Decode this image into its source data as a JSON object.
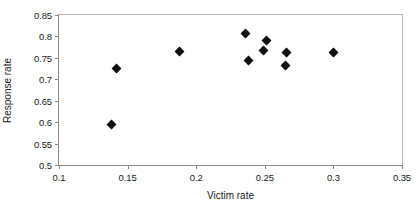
{
  "chart_data": {
    "type": "scatter",
    "title": "",
    "xlabel": "Victim rate",
    "ylabel": "Response rate",
    "xlim": [
      0.1,
      0.35
    ],
    "ylim": [
      0.5,
      0.85
    ],
    "xticks": [
      "0.1",
      "0.15",
      "0.2",
      "0.25",
      "0.3",
      "0.35"
    ],
    "xtick_values": [
      0.1,
      0.15,
      0.2,
      0.25,
      0.3,
      0.35
    ],
    "yticks": [
      "0.5",
      "0.55",
      "0.6",
      "0.65",
      "0.7",
      "0.75",
      "0.8",
      "0.85"
    ],
    "ytick_values": [
      0.5,
      0.55,
      0.6,
      0.65,
      0.7,
      0.75,
      0.8,
      0.85
    ],
    "grid": false,
    "legend": false,
    "marker": "diamond",
    "marker_color": "#111111",
    "series": [
      {
        "name": "observations",
        "points": [
          {
            "x": 0.138,
            "y": 0.594
          },
          {
            "x": 0.142,
            "y": 0.726
          },
          {
            "x": 0.188,
            "y": 0.764
          },
          {
            "x": 0.236,
            "y": 0.806
          },
          {
            "x": 0.238,
            "y": 0.744
          },
          {
            "x": 0.249,
            "y": 0.767
          },
          {
            "x": 0.251,
            "y": 0.79
          },
          {
            "x": 0.265,
            "y": 0.733
          },
          {
            "x": 0.266,
            "y": 0.763
          },
          {
            "x": 0.3,
            "y": 0.763
          }
        ]
      }
    ]
  }
}
